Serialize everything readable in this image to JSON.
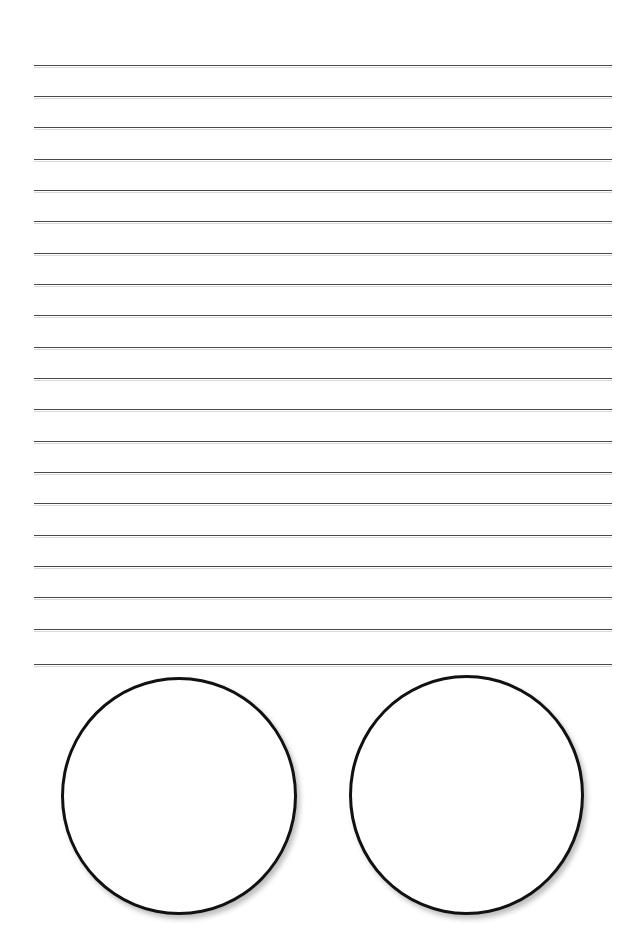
{
  "page": {
    "background_color": "#ffffff",
    "width": 641,
    "height": 944
  },
  "ruled_lines": {
    "count": 20,
    "color": "#3a3a3c",
    "thickness_px": 1.6,
    "left_x": 34,
    "right_x": 612,
    "spacing_px": 31.5,
    "first_y": 65,
    "last_y": 664,
    "y_positions": [
      65,
      96,
      127,
      159,
      190,
      221,
      253,
      284,
      315,
      347,
      378,
      409,
      441,
      472,
      503,
      535,
      566,
      597,
      629,
      664
    ]
  },
  "shapes": {
    "type": "circle",
    "count": 2,
    "stroke_color": "#111113",
    "fill_color": "#ffffff",
    "stroke_width_px": 3,
    "shadow_color": "rgba(60,60,62,0.33)",
    "items": [
      {
        "name": "left-circle",
        "left": 61,
        "top": 677,
        "width": 236,
        "height": 238,
        "center_x": 179,
        "center_y": 796,
        "diameter": 237
      },
      {
        "name": "right-circle",
        "left": 349,
        "top": 675,
        "width": 235,
        "height": 240,
        "center_x": 466,
        "center_y": 795,
        "diameter": 237
      }
    ]
  }
}
